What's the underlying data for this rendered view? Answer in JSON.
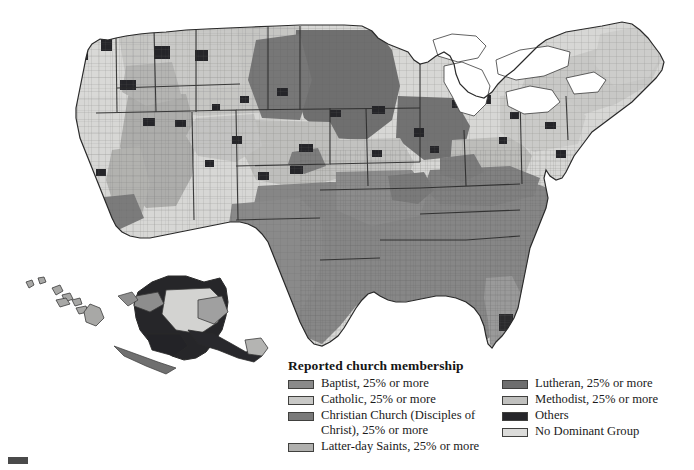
{
  "figure": {
    "kind": "choropleth-map",
    "background_color": "#ffffff",
    "insets": [
      "Alaska",
      "Hawaii"
    ]
  },
  "legend": {
    "title": "Reported church membership",
    "columns": [
      {
        "name": "left",
        "items": [
          {
            "label": "Baptist, 25% or more",
            "color": "#8a8a8a"
          },
          {
            "label": "Catholic, 25% or more",
            "color": "#c8c8c6"
          },
          {
            "label": "Christian Church (Disciples of\nChrist), 25% or more",
            "color": "#7a7a7a"
          },
          {
            "label": "Latter-day Saints, 25% or more",
            "color": "#b0b0ae"
          }
        ]
      },
      {
        "name": "right",
        "items": [
          {
            "label": "Lutheran, 25% or more",
            "color": "#6e6e6e"
          },
          {
            "label": "Methodist, 25% or more",
            "color": "#c0c0be"
          },
          {
            "label": "Others",
            "color": "#26262a"
          },
          {
            "label": "No Dominant Group",
            "color": "#dcdcda"
          }
        ]
      }
    ]
  },
  "map_data": {
    "type": "choropleth",
    "geography": "US counties (lower 48) with Alaska and Hawaii insets",
    "classes": [
      {
        "key": "baptist",
        "label": "Baptist, 25% or more",
        "color": "#8a8a8a"
      },
      {
        "key": "catholic",
        "label": "Catholic, 25% or more",
        "color": "#c8c8c6"
      },
      {
        "key": "disciples",
        "label": "Christian Church (Disciples of Christ), 25% or more",
        "color": "#7a7a7a"
      },
      {
        "key": "lds",
        "label": "Latter-day Saints, 25% or more",
        "color": "#b0b0ae"
      },
      {
        "key": "lutheran",
        "label": "Lutheran, 25% or more",
        "color": "#6e6e6e"
      },
      {
        "key": "methodist",
        "label": "Methodist, 25% or more",
        "color": "#c0c0be"
      },
      {
        "key": "others",
        "label": "Others",
        "color": "#26262a"
      },
      {
        "key": "none",
        "label": "No Dominant Group",
        "color": "#dcdcda"
      }
    ],
    "regional_pattern": [
      {
        "region": "Southeast (Deep South, Appalachia, Texas east)",
        "dominant": "baptist"
      },
      {
        "region": "Upper Midwest (Minnesota, Dakotas, Wisconsin)",
        "dominant": "lutheran"
      },
      {
        "region": "Northeast and Great Lakes cities",
        "dominant": "catholic"
      },
      {
        "region": "Utah, southern Idaho, eastern Nevada",
        "dominant": "lds"
      },
      {
        "region": "Kansas, Nebraska, Iowa, Ohio farm belt",
        "dominant": "methodist"
      },
      {
        "region": "Missouri, Kentucky, Indiana border counties",
        "dominant": "disciples"
      },
      {
        "region": "Alaska interior and Great Plains reservations",
        "dominant": "others"
      },
      {
        "region": "Pacific Northwest, northern California, Nevada",
        "dominant": "none"
      }
    ]
  },
  "page_mark": {
    "present": true
  }
}
